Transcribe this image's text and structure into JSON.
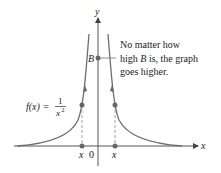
{
  "axes": {
    "x_label": "x",
    "y_label": "y",
    "origin_label": "0"
  },
  "function": {
    "lhs": "f(x) =",
    "numerator": "1",
    "denominator_base": "x",
    "denominator_exp": "2"
  },
  "point_B_label": "B",
  "annotation": {
    "line1": "No matter how",
    "line2_prefix": "high ",
    "line2_B": "B",
    "line2_suffix": " is, the graph",
    "line3": "goes higher."
  },
  "tick_labels": {
    "left_x": "x",
    "right_x": "x"
  },
  "colors": {
    "curve": "#6e6e6e",
    "axis": "#555555",
    "point": "#666666",
    "text": "#222222"
  }
}
